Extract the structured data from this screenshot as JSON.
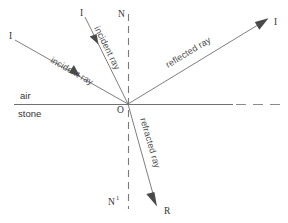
{
  "figure": {
    "type": "ray-diagram",
    "background": "#ffffff"
  },
  "colors": {
    "ray": "#6f6f6f",
    "normal": "#7a7a7a",
    "surface": "#707070",
    "arrow": "#4a4a4a",
    "text": "#333333",
    "label_text": "#4d4d4d"
  },
  "media": {
    "upper": "air",
    "lower": "stone"
  },
  "points": {
    "origin": "O",
    "normal_top": "N",
    "normal_bottom": "N",
    "normal_bottom_sup": "1",
    "incident_start_left": "I",
    "incident_start_inner": "I",
    "reflected_end": "I",
    "refracted_end": "R"
  },
  "rays": [
    {
      "name": "incident-ray-outer",
      "label": "incident ray",
      "from": "I",
      "to": "O",
      "x1": 15,
      "y1": 40,
      "x2": 128,
      "y2": 104,
      "arrow_t": 0.58,
      "label_x": 50,
      "label_y": 62,
      "label_rotate": 29.5
    },
    {
      "name": "incident-ray-inner",
      "label": "incident ray",
      "from": "I",
      "to": "O",
      "x1": 85,
      "y1": 17,
      "x2": 128,
      "y2": 104,
      "arrow_t": 0.3,
      "label_x": 93,
      "label_y": 28,
      "label_rotate": 63.5
    },
    {
      "name": "reflected-ray",
      "label": "reflected ray",
      "from": "O",
      "to": "I",
      "x1": 128,
      "y1": 104,
      "x2": 268,
      "y2": 19,
      "arrow_t": 1.0,
      "label_x": 168,
      "label_y": 66,
      "label_rotate": -31.3
    },
    {
      "name": "refracted-ray",
      "label": "refracted ray",
      "from": "O",
      "to": "R",
      "x1": 128,
      "y1": 104,
      "x2": 157,
      "y2": 205,
      "arrow_t": 1.0,
      "label_x": 139,
      "label_y": 118,
      "label_rotate": 73.5
    }
  ],
  "normal": {
    "name": "normal-line",
    "x": 128,
    "y_top": 14,
    "y_bottom": 209
  },
  "surface": {
    "name": "interface-line",
    "y": 104,
    "x_start": 14,
    "x_solid_end": 233,
    "x_dash_start": 236,
    "x_end": 282
  },
  "labels": {
    "air": {
      "text": "air",
      "x": 20,
      "y": 99
    },
    "stone": {
      "text": "stone",
      "x": 18,
      "y": 116
    },
    "origin": {
      "text": "O",
      "x": 117,
      "y": 112
    },
    "normal_top": {
      "text": "N",
      "x": 119,
      "y": 16
    },
    "normal_bottom": {
      "text": "N",
      "x": 110,
      "y": 204
    },
    "normal_bottom_sup": {
      "text": "1",
      "x": 118,
      "y": 200
    },
    "incident_left": {
      "text": "I",
      "x": 9,
      "y": 38
    },
    "incident_inner": {
      "text": "I",
      "x": 80,
      "y": 15
    },
    "reflected_end": {
      "text": "I",
      "x": 274,
      "y": 24
    },
    "refracted_end": {
      "text": "R",
      "x": 164,
      "y": 213
    }
  }
}
